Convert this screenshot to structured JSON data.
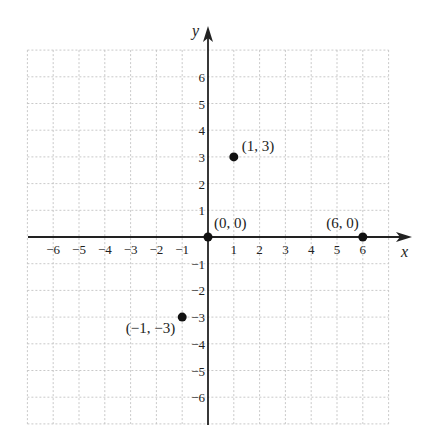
{
  "chart_data": {
    "type": "scatter",
    "title": "",
    "xlabel": "x",
    "ylabel": "y",
    "xlim": [
      -7,
      7
    ],
    "ylim": [
      -7,
      7
    ],
    "grid": true,
    "x_ticks": [
      -6,
      -5,
      -4,
      -3,
      -2,
      -1,
      1,
      2,
      3,
      4,
      5,
      6
    ],
    "y_ticks": [
      6,
      5,
      4,
      3,
      2,
      1,
      -1,
      -2,
      -3,
      -4,
      -5,
      -6
    ],
    "x_tick_labels": [
      "−6",
      "−5",
      "−4",
      "−3",
      "−2",
      "−1",
      "1",
      "2",
      "3",
      "4",
      "5",
      "6"
    ],
    "y_tick_labels": [
      "6",
      "5",
      "4",
      "3",
      "2",
      "1",
      "−1",
      "−2",
      "−3",
      "−4",
      "−5",
      "−6"
    ],
    "points": [
      {
        "x": 1,
        "y": 3,
        "label": "(1, 3)"
      },
      {
        "x": 0,
        "y": 0,
        "label": "(0, 0)"
      },
      {
        "x": 6,
        "y": 0,
        "label": "(6, 0)"
      },
      {
        "x": -1,
        "y": -3,
        "label": "(−1, −3)"
      }
    ]
  },
  "colors": {
    "axis": "#222222",
    "grid": "#bbbbbb",
    "point": "#111111"
  }
}
